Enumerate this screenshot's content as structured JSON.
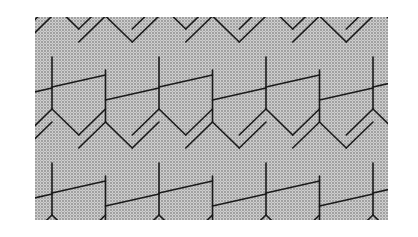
{
  "image": {
    "description": "Halftone-shaded tiling of elongated hexagons with slanted dividing lines",
    "background": "#ffffff",
    "panel": {
      "x": 35,
      "y": 17,
      "width": 353,
      "height": 203
    },
    "fill_color": "#bdbdbd",
    "line_color": "#1a1a1a",
    "tiling": {
      "column_spacing": 53.5,
      "first_column_x": 17,
      "column_offset_y": 13,
      "tile_height": 106,
      "peak_height": 26,
      "slant_rise": 12
    }
  }
}
